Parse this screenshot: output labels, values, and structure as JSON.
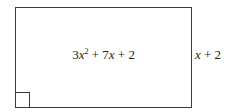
{
  "diagram": {
    "shape": "rectangle",
    "area_expression": {
      "coef_a": "3",
      "var": "x",
      "exp": "2",
      "plus1": " + ",
      "coef_b": "7",
      "var2": "x",
      "plus2": " + ",
      "const": "2",
      "full_text": "3x² + 7x + 2"
    },
    "side_label": {
      "var": "x",
      "rest": " + 2",
      "full_text": "x + 2"
    },
    "right_angle_marker": "bottom-left",
    "line_color": "#3a3a3a",
    "text_color": "#222222"
  }
}
